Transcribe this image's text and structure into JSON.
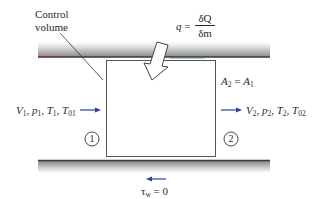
{
  "diagram": {
    "type": "control-volume-1d-flow-with-heat-addition",
    "control_volume_label": [
      "Control",
      "volume"
    ],
    "heat_transfer": {
      "lhs": "q",
      "equals": "=",
      "numerator": "δQ",
      "denominator": "δm"
    },
    "area_relation": {
      "lhs_base": "A",
      "lhs_sub": "2",
      "equals": "=",
      "rhs_base": "A",
      "rhs_sub": "1"
    },
    "inlet": {
      "station": "1",
      "vars": [
        {
          "base": "V",
          "sub": "1"
        },
        {
          "base": "p",
          "sub": "1"
        },
        {
          "base": "T",
          "sub": "1"
        },
        {
          "base": "T",
          "sub": "01"
        }
      ]
    },
    "outlet": {
      "station": "2",
      "vars": [
        {
          "base": "V",
          "sub": "2"
        },
        {
          "base": "p",
          "sub": "2"
        },
        {
          "base": "T",
          "sub": "2"
        },
        {
          "base": "T",
          "sub": "02"
        }
      ]
    },
    "wall_shear": {
      "symbol": "τ",
      "sub": "w",
      "equals": "=",
      "value": "0"
    },
    "colors": {
      "arrow_blue": "#2b3fa0",
      "wall_dark": "#3a3a3a",
      "box_line": "#555555",
      "top_wall_accent_red": "#c0404a",
      "top_wall_accent_green": "#4caf50"
    }
  }
}
